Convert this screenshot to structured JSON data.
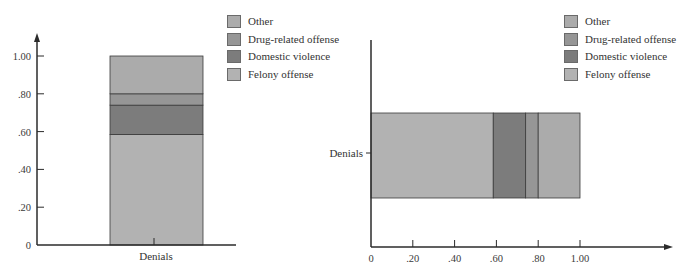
{
  "chart_data": [
    {
      "type": "bar",
      "orientation": "vertical",
      "stacked": true,
      "title": "",
      "xlabel": "",
      "ylabel": "",
      "categories": [
        "Denials"
      ],
      "series": [
        {
          "name": "Felony offense",
          "values": [
            0.585
          ],
          "color": "#b2b2b2"
        },
        {
          "name": "Domestic violence",
          "values": [
            0.155
          ],
          "color": "#7c7c7c"
        },
        {
          "name": "Drug-related offense",
          "values": [
            0.06
          ],
          "color": "#969696"
        },
        {
          "name": "Other",
          "values": [
            0.2
          ],
          "color": "#ababab"
        }
      ],
      "yticks": [
        "0",
        ".20",
        ".40",
        ".60",
        ".80",
        "1.00"
      ],
      "ylim": [
        0,
        1.0
      ],
      "grid": false,
      "legend_position": "upper right",
      "legend": [
        "Other",
        "Drug-related offense",
        "Domestic violence",
        "Felony offense"
      ]
    },
    {
      "type": "bar",
      "orientation": "horizontal",
      "stacked": true,
      "title": "",
      "xlabel": "",
      "ylabel": "",
      "categories": [
        "Denials"
      ],
      "series": [
        {
          "name": "Felony offense",
          "values": [
            0.585
          ],
          "color": "#b2b2b2"
        },
        {
          "name": "Domestic violence",
          "values": [
            0.155
          ],
          "color": "#7c7c7c"
        },
        {
          "name": "Drug-related offense",
          "values": [
            0.06
          ],
          "color": "#969696"
        },
        {
          "name": "Other",
          "values": [
            0.2
          ],
          "color": "#ababab"
        }
      ],
      "xticks": [
        "0",
        ".20",
        ".40",
        ".60",
        ".80",
        "1.00"
      ],
      "xlim": [
        0,
        1.0
      ],
      "grid": false,
      "legend_position": "upper right",
      "legend": [
        "Other",
        "Drug-related offense",
        "Domestic violence",
        "Felony offense"
      ]
    }
  ],
  "left_chart": {
    "category_label": "Denials",
    "ticks": [
      "0",
      ".20",
      ".40",
      ".60",
      ".80",
      "1.00"
    ],
    "legend": [
      {
        "label": "Other",
        "color": "#ababab"
      },
      {
        "label": "Drug-related offense",
        "color": "#969696"
      },
      {
        "label": "Domestic violence",
        "color": "#7c7c7c"
      },
      {
        "label": "Felony offense",
        "color": "#b2b2b2"
      }
    ]
  },
  "right_chart": {
    "category_label": "Denials",
    "ticks": [
      "0",
      ".20",
      ".40",
      ".60",
      ".80",
      "1.00"
    ],
    "legend": [
      {
        "label": "Other",
        "color": "#ababab"
      },
      {
        "label": "Drug-related offense",
        "color": "#969696"
      },
      {
        "label": "Domestic violence",
        "color": "#7c7c7c"
      },
      {
        "label": "Felony offense",
        "color": "#b2b2b2"
      }
    ]
  }
}
